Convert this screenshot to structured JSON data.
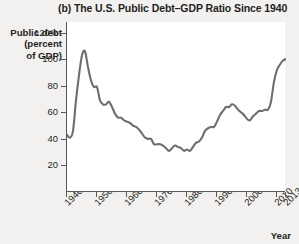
{
  "chart_data": {
    "type": "line",
    "title": "(b) The U.S. Public Debt–GDP Ratio Since 1940",
    "xlabel": "Year",
    "ylabel_lines": [
      "Public debt",
      "(percent",
      "of GDP)"
    ],
    "ylabel": "Public debt (percent of GDP)",
    "xlim": [
      1940,
      2013
    ],
    "ylim": [
      0,
      128
    ],
    "grid": false,
    "legend": null,
    "line_color": "#6d6e71",
    "y_ticks": [
      {
        "value": 120,
        "label": "120%"
      },
      {
        "value": 100,
        "label": "100"
      },
      {
        "value": 80,
        "label": "80"
      },
      {
        "value": 60,
        "label": "60"
      },
      {
        "value": 40,
        "label": "40"
      },
      {
        "value": 20,
        "label": "20"
      }
    ],
    "x_ticks": [
      {
        "value": 1940,
        "label": "1940"
      },
      {
        "value": 1950,
        "label": "1950"
      },
      {
        "value": 1960,
        "label": "1960"
      },
      {
        "value": 1970,
        "label": "1970"
      },
      {
        "value": 1980,
        "label": "1980"
      },
      {
        "value": 1990,
        "label": "1990"
      },
      {
        "value": 2000,
        "label": "2000"
      },
      {
        "value": 2010,
        "label": "2010"
      },
      {
        "value": 2013,
        "label": "2013"
      }
    ],
    "x": [
      1940,
      1941,
      1942,
      1943,
      1944,
      1945,
      1946,
      1947,
      1948,
      1949,
      1950,
      1951,
      1952,
      1953,
      1954,
      1955,
      1956,
      1957,
      1958,
      1959,
      1960,
      1961,
      1962,
      1963,
      1964,
      1965,
      1966,
      1967,
      1968,
      1969,
      1970,
      1971,
      1972,
      1973,
      1974,
      1975,
      1976,
      1977,
      1978,
      1979,
      1980,
      1981,
      1982,
      1983,
      1984,
      1985,
      1986,
      1987,
      1988,
      1989,
      1990,
      1991,
      1992,
      1993,
      1994,
      1995,
      1996,
      1997,
      1998,
      1999,
      2000,
      2001,
      2002,
      2003,
      2004,
      2005,
      2006,
      2007,
      2008,
      2009,
      2010,
      2011,
      2012,
      2013
    ],
    "values": [
      43,
      41,
      46,
      69,
      88,
      103,
      106,
      94,
      84,
      79,
      79,
      69,
      66,
      66,
      68,
      64,
      59,
      56,
      56,
      54,
      53,
      52,
      50,
      49,
      47,
      44,
      41,
      40,
      40,
      36,
      36,
      36,
      35,
      33,
      31,
      33,
      35,
      34,
      33,
      31,
      32,
      31,
      34,
      37,
      38,
      41,
      46,
      48,
      49,
      49,
      53,
      58,
      61,
      64,
      64,
      66,
      65,
      62,
      60,
      58,
      55,
      54,
      57,
      59,
      61,
      61,
      62,
      62,
      68,
      83,
      92,
      96,
      99,
      100
    ],
    "annotations": [
      {
        "text": "Peak during World War II",
        "year": 1946,
        "value": 106
      },
      {
        "text": "Trough in mid-1970s",
        "year": 1974,
        "value": 31
      }
    ]
  }
}
